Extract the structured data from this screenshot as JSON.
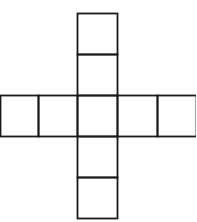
{
  "diagram": {
    "type": "cross-shaped net of squares",
    "stroke_color": "#1a1a1a",
    "background": "#ffffff",
    "cells": [
      {
        "id": "top-1",
        "x": 77,
        "y": 13,
        "w": 40,
        "h": 41
      },
      {
        "id": "top-2",
        "x": 77,
        "y": 54,
        "w": 40,
        "h": 41
      },
      {
        "id": "row-left-outer",
        "x": 0,
        "y": 95,
        "w": 38,
        "h": 41
      },
      {
        "id": "row-left",
        "x": 38,
        "y": 95,
        "w": 39,
        "h": 41
      },
      {
        "id": "center",
        "x": 77,
        "y": 95,
        "w": 40,
        "h": 41
      },
      {
        "id": "row-right",
        "x": 117,
        "y": 95,
        "w": 40,
        "h": 41
      },
      {
        "id": "row-right-outer",
        "x": 157,
        "y": 95,
        "w": 39,
        "h": 41
      },
      {
        "id": "bottom-1",
        "x": 77,
        "y": 136,
        "w": 40,
        "h": 41
      },
      {
        "id": "bottom-2",
        "x": 77,
        "y": 177,
        "w": 40,
        "h": 41
      }
    ]
  }
}
